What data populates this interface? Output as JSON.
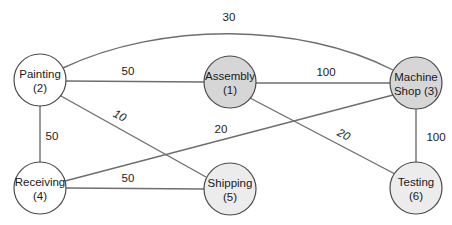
{
  "diagram": {
    "title": "",
    "colors": {
      "white_node": "#ffffff",
      "gray_node": "#d6d6d6",
      "light_node": "#ececec",
      "edge": "#6e6e6e",
      "outline": "#4a4a4a"
    },
    "nodes": [
      {
        "id": 1,
        "line1": "Assembly",
        "line2": "(1)",
        "cx": 230,
        "cy": 82,
        "fill": "#d6d6d6"
      },
      {
        "id": 2,
        "line1": "Painting",
        "line2": "(2)",
        "cx": 40,
        "cy": 80,
        "fill": "#ffffff"
      },
      {
        "id": 3,
        "line1": "Machine",
        "line2": "Shop (3)",
        "cx": 416,
        "cy": 83,
        "fill": "#d6d6d6"
      },
      {
        "id": 4,
        "line1": "Receiving",
        "line2": "(4)",
        "cx": 40,
        "cy": 188,
        "fill": "#ffffff"
      },
      {
        "id": 5,
        "line1": "Shipping",
        "line2": "(5)",
        "cx": 230,
        "cy": 189,
        "fill": "#ececec"
      },
      {
        "id": 6,
        "line1": "Testing",
        "line2": "(6)",
        "cx": 416,
        "cy": 188,
        "fill": "#ececec"
      }
    ],
    "edges": [
      {
        "from": 2,
        "to": 3,
        "weight": "30"
      },
      {
        "from": 2,
        "to": 1,
        "weight": "50"
      },
      {
        "from": 1,
        "to": 3,
        "weight": "100"
      },
      {
        "from": 2,
        "to": 4,
        "weight": "50"
      },
      {
        "from": 2,
        "to": 5,
        "weight": "10"
      },
      {
        "from": 4,
        "to": 3,
        "weight": "20"
      },
      {
        "from": 1,
        "to": 6,
        "weight": "20"
      },
      {
        "from": 3,
        "to": 6,
        "weight": "100"
      },
      {
        "from": 4,
        "to": 5,
        "weight": "50"
      }
    ]
  }
}
